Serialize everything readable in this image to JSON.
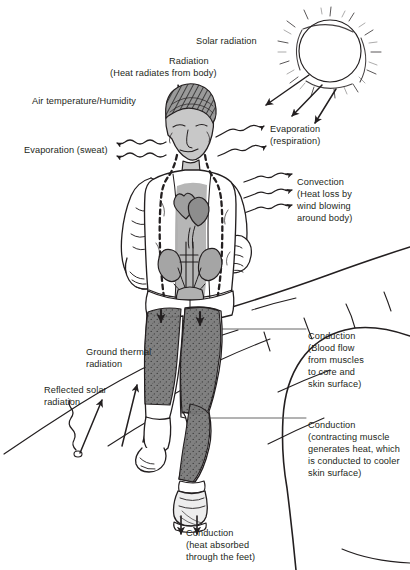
{
  "diagram": {
    "background_color": "#ffffff",
    "ink_color": "#231f20",
    "skin_shade": "#b9b9b9",
    "muscle_shade": "#6e6e6e",
    "labels": [
      {
        "id": "solar-radiation",
        "text": "Solar radiation",
        "x": 196,
        "y": 36,
        "align": "left"
      },
      {
        "id": "radiation",
        "text": "Radiation",
        "x": 169,
        "y": 56,
        "align": "left"
      },
      {
        "id": "radiation-sub",
        "text": "(Heat radiates from body)",
        "x": 110,
        "y": 68,
        "align": "left"
      },
      {
        "id": "air-temperature",
        "text": "Air temperature/Humidity",
        "x": 32,
        "y": 96,
        "align": "left"
      },
      {
        "id": "evaporation-sweat",
        "text": "Evaporation (sweat)",
        "x": 24,
        "y": 145,
        "align": "left"
      },
      {
        "id": "evaporation-respiration",
        "text": "Evaporation",
        "x": 270,
        "y": 124,
        "align": "left"
      },
      {
        "id": "evaporation-respiration-sub",
        "text": "(respiration)",
        "x": 270,
        "y": 136,
        "align": "left"
      },
      {
        "id": "convection",
        "text": "Convection",
        "x": 297,
        "y": 177,
        "align": "left"
      },
      {
        "id": "convection-l2",
        "text": "(Heat loss by",
        "x": 297,
        "y": 189,
        "align": "left"
      },
      {
        "id": "convection-l3",
        "text": "wind blowing",
        "x": 297,
        "y": 201,
        "align": "left"
      },
      {
        "id": "convection-l4",
        "text": "around body)",
        "x": 297,
        "y": 213,
        "align": "left"
      },
      {
        "id": "conduction-blood",
        "text": "Conduction",
        "x": 308,
        "y": 331,
        "align": "left"
      },
      {
        "id": "conduction-blood-l2",
        "text": "(Blood flow",
        "x": 308,
        "y": 343,
        "align": "left"
      },
      {
        "id": "conduction-blood-l3",
        "text": "from muscles",
        "x": 308,
        "y": 355,
        "align": "left"
      },
      {
        "id": "conduction-blood-l4",
        "text": "to core and",
        "x": 308,
        "y": 367,
        "align": "left"
      },
      {
        "id": "conduction-blood-l5",
        "text": "skin surface)",
        "x": 308,
        "y": 379,
        "align": "left"
      },
      {
        "id": "ground-thermal",
        "text": "Ground thermal",
        "x": 86,
        "y": 347,
        "align": "left"
      },
      {
        "id": "ground-thermal-l2",
        "text": "radiation",
        "x": 86,
        "y": 359,
        "align": "left"
      },
      {
        "id": "reflected-solar",
        "text": "Reflected solar",
        "x": 44,
        "y": 385,
        "align": "left"
      },
      {
        "id": "reflected-solar-l2",
        "text": "radiation",
        "x": 44,
        "y": 397,
        "align": "left"
      },
      {
        "id": "conduction-muscle",
        "text": "Conduction",
        "x": 308,
        "y": 420,
        "align": "left"
      },
      {
        "id": "conduction-muscle-l2",
        "text": "(contracting muscle",
        "x": 308,
        "y": 432,
        "align": "left"
      },
      {
        "id": "conduction-muscle-l3",
        "text": "generates heat, which",
        "x": 308,
        "y": 444,
        "align": "left"
      },
      {
        "id": "conduction-muscle-l4",
        "text": "is conducted to cooler",
        "x": 308,
        "y": 456,
        "align": "left"
      },
      {
        "id": "conduction-muscle-l5",
        "text": "skin surface)",
        "x": 308,
        "y": 468,
        "align": "left"
      },
      {
        "id": "conduction-feet",
        "text": "Conduction",
        "x": 186,
        "y": 528,
        "align": "left"
      },
      {
        "id": "conduction-feet-l2",
        "text": "(heat absorbed",
        "x": 186,
        "y": 540,
        "align": "left"
      },
      {
        "id": "conduction-feet-l3",
        "text": "through the feet)",
        "x": 186,
        "y": 552,
        "align": "left"
      }
    ],
    "heat_pathways": [
      {
        "name": "solar-radiation",
        "direction": "incoming",
        "arrow_style": "straight",
        "count": 3
      },
      {
        "name": "radiation-from-body",
        "direction": "outgoing",
        "arrow_style": "wavy",
        "count": 2
      },
      {
        "name": "evaporation-sweat",
        "direction": "outgoing",
        "arrow_style": "wavy",
        "count": 2
      },
      {
        "name": "evaporation-respiration",
        "direction": "outgoing",
        "arrow_style": "wavy",
        "count": 2
      },
      {
        "name": "convection",
        "direction": "outgoing",
        "arrow_style": "wavy",
        "count": 3
      },
      {
        "name": "ground-thermal-radiation",
        "direction": "incoming",
        "arrow_style": "straight",
        "count": 3
      },
      {
        "name": "reflected-solar-radiation",
        "direction": "incoming",
        "arrow_style": "wavy",
        "count": 1
      },
      {
        "name": "conduction-feet",
        "direction": "incoming",
        "arrow_style": "straight",
        "count": 2
      }
    ],
    "anatomy": [
      {
        "name": "sun",
        "label": "sun"
      },
      {
        "name": "runner",
        "label": "runner"
      },
      {
        "name": "head",
        "label": "head"
      },
      {
        "name": "torso-core",
        "label": "body core (dashed outline)"
      },
      {
        "name": "heart",
        "label": "heart"
      },
      {
        "name": "kidneys",
        "label": "kidneys"
      },
      {
        "name": "bladder",
        "label": "bladder"
      },
      {
        "name": "thigh-muscle",
        "label": "thigh muscle"
      },
      {
        "name": "calf-muscle",
        "label": "calf muscle"
      },
      {
        "name": "shoe",
        "label": "running shoe"
      },
      {
        "name": "road",
        "label": "road"
      }
    ]
  }
}
